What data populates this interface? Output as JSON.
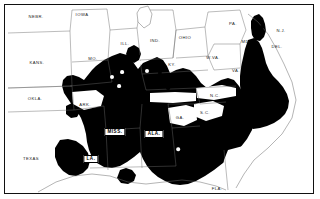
{
  "map": {
    "title": "Eastern United States distribution map",
    "frame": {
      "stroke": "#111111",
      "fill": "#ffffff"
    },
    "colors": {
      "shaded_region": "#000000",
      "unshaded_region": "#ffffff",
      "border_line": "#555555",
      "label_text": "#1a1a1a",
      "label_text_on_dark": "#ffffff",
      "box_label_fill": "#ffffff",
      "box_label_text": "#000000"
    },
    "state_labels": [
      {
        "name": "NEBR",
        "text": "NEBR.",
        "x": 36,
        "y": 16,
        "on_dark": false
      },
      {
        "name": "IOWA",
        "text": "IOWA",
        "x": 82,
        "y": 14,
        "on_dark": false
      },
      {
        "name": "KANS",
        "text": "KANS.",
        "x": 37,
        "y": 62,
        "on_dark": false
      },
      {
        "name": "MO",
        "text": "MO.",
        "x": 93,
        "y": 58,
        "on_dark": false
      },
      {
        "name": "ILL",
        "text": "ILL.",
        "x": 125,
        "y": 43,
        "on_dark": false
      },
      {
        "name": "IND",
        "text": "IND.",
        "x": 155,
        "y": 40,
        "on_dark": false
      },
      {
        "name": "OHIO",
        "text": "OHIO",
        "x": 185,
        "y": 37,
        "on_dark": false
      },
      {
        "name": "PA",
        "text": "PA.",
        "x": 233,
        "y": 23,
        "on_dark": false
      },
      {
        "name": "NJ",
        "text": "N.J.",
        "x": 281,
        "y": 30,
        "on_dark": false
      },
      {
        "name": "MD",
        "text": "MD.",
        "x": 246,
        "y": 41,
        "on_dark": false
      },
      {
        "name": "DEL",
        "text": "DEL.",
        "x": 277,
        "y": 46,
        "on_dark": false
      },
      {
        "name": "WVA",
        "text": "W.VA.",
        "x": 213,
        "y": 57,
        "on_dark": false
      },
      {
        "name": "VA",
        "text": "VA.",
        "x": 236,
        "y": 70,
        "on_dark": false
      },
      {
        "name": "KY",
        "text": "KY.",
        "x": 172,
        "y": 64,
        "on_dark": false
      },
      {
        "name": "TENN",
        "text": "TENN.",
        "x": 166,
        "y": 98,
        "on_dark": true
      },
      {
        "name": "NC",
        "text": "N.C.",
        "x": 215,
        "y": 95,
        "on_dark": false
      },
      {
        "name": "SC",
        "text": "S.C.",
        "x": 205,
        "y": 112,
        "on_dark": false
      },
      {
        "name": "GA",
        "text": "GA.",
        "x": 180,
        "y": 117,
        "on_dark": false
      },
      {
        "name": "ARK",
        "text": "ARK.",
        "x": 85,
        "y": 104,
        "on_dark": false
      },
      {
        "name": "OKLA",
        "text": "OKLA.",
        "x": 35,
        "y": 98,
        "on_dark": false
      },
      {
        "name": "TEXAS",
        "text": "TEXAS",
        "x": 31,
        "y": 158,
        "on_dark": false
      },
      {
        "name": "FLA",
        "text": "FLA.",
        "x": 217,
        "y": 188,
        "on_dark": false
      }
    ],
    "boxed_labels": [
      {
        "name": "LA",
        "text": "LA.",
        "x": 91,
        "y": 159
      },
      {
        "name": "MISS",
        "text": "MISS.",
        "x": 115,
        "y": 132
      },
      {
        "name": "ALA",
        "text": "ALA.",
        "x": 154,
        "y": 134
      }
    ],
    "markers": [
      {
        "name": "marker-1",
        "x": 119,
        "y": 60,
        "r": 2.1,
        "fill": "black"
      },
      {
        "name": "marker-2",
        "x": 131,
        "y": 66,
        "r": 2.0,
        "fill": "black"
      },
      {
        "name": "marker-3",
        "x": 140,
        "y": 63,
        "r": 2.2,
        "fill": "white"
      },
      {
        "name": "marker-4",
        "x": 147,
        "y": 71,
        "r": 2.0,
        "fill": "white"
      },
      {
        "name": "marker-5",
        "x": 160,
        "y": 73,
        "r": 2.1,
        "fill": "black"
      },
      {
        "name": "marker-6",
        "x": 172,
        "y": 76,
        "r": 2.2,
        "fill": "black"
      },
      {
        "name": "marker-7",
        "x": 189,
        "y": 78,
        "r": 2.0,
        "fill": "black"
      },
      {
        "name": "marker-8",
        "x": 141,
        "y": 84,
        "r": 1.9,
        "fill": "black"
      },
      {
        "name": "marker-9",
        "x": 156,
        "y": 86,
        "r": 1.9,
        "fill": "black"
      },
      {
        "name": "marker-10",
        "x": 168,
        "y": 88,
        "r": 1.9,
        "fill": "black"
      },
      {
        "name": "marker-11",
        "x": 112,
        "y": 77,
        "r": 2.0,
        "fill": "white"
      },
      {
        "name": "marker-12",
        "x": 122,
        "y": 72,
        "r": 1.9,
        "fill": "white"
      },
      {
        "name": "marker-13",
        "x": 119,
        "y": 86,
        "r": 1.9,
        "fill": "white"
      },
      {
        "name": "marker-14",
        "x": 262,
        "y": 27,
        "r": 2.0,
        "fill": "black"
      },
      {
        "name": "marker-15",
        "x": 178,
        "y": 149,
        "r": 1.8,
        "fill": "white"
      }
    ]
  }
}
